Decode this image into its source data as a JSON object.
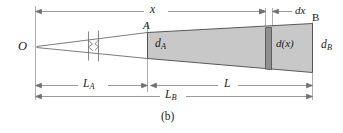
{
  "figure": {
    "caption": "(b)",
    "colors": {
      "body_fill": "#c8c8c8",
      "slice_fill": "#8f8f8f",
      "outline": "#4a4a4a",
      "dimension_line": "#6e6e6e",
      "text": "#1a1a1a",
      "background": "#ffffff"
    },
    "labels": {
      "origin": "O",
      "section_a": "A",
      "section_b": "B",
      "diameter_a": "d",
      "diameter_a_sub": "A",
      "diameter_b": "d",
      "diameter_b_sub": "B",
      "diameter_x": "d(x)",
      "distance_x": "x",
      "element_dx": "dx",
      "length_a": "L",
      "length_a_sub": "A",
      "length_l": "L",
      "length_b": "L",
      "length_b_sub": "B"
    },
    "dimensions": [
      {
        "name": "x",
        "from": "O",
        "to": "element-left",
        "position": "top"
      },
      {
        "name": "dx",
        "from": "element-left",
        "to": "B",
        "position": "top"
      },
      {
        "name": "L_A",
        "from": "O",
        "to": "A",
        "position": "bottom"
      },
      {
        "name": "L",
        "from": "A",
        "to": "B",
        "position": "bottom"
      },
      {
        "name": "L_B",
        "from": "O",
        "to": "B",
        "position": "bottom"
      }
    ],
    "break_symbol": {
      "present": true,
      "type": "double-zigzag-break"
    }
  }
}
